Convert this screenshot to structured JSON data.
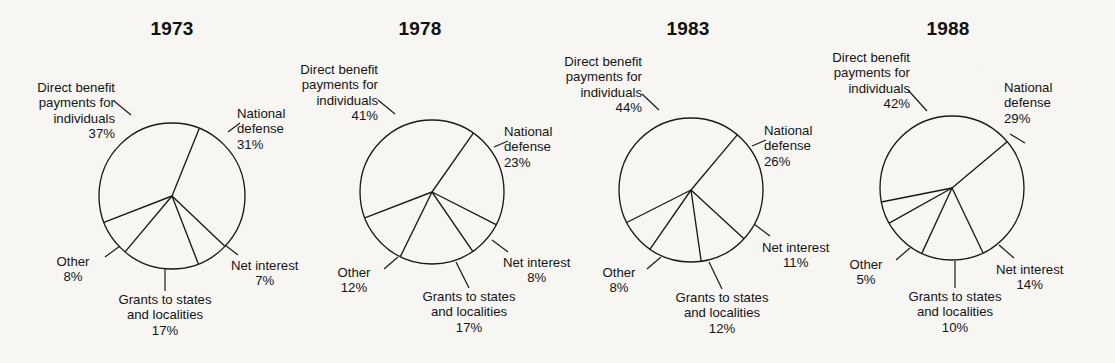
{
  "figure": {
    "background_color": "#f7f6f3",
    "ink_color": "#141414"
  },
  "chart_data": [
    {
      "type": "pie",
      "title": "1973",
      "labels": [
        "National defense",
        "Net interest",
        "Grants to states and localities",
        "Other",
        "Direct benefit payments for individuals"
      ],
      "values": [
        31,
        7,
        17,
        8,
        37
      ],
      "unit": "%",
      "start_angle_deg": -68,
      "direction": "clockwise"
    },
    {
      "type": "pie",
      "title": "1978",
      "labels": [
        "National defense",
        "Net interest",
        "Grants to states and localities",
        "Other",
        "Direct benefit payments for individuals"
      ],
      "values": [
        23,
        8,
        17,
        12,
        41
      ],
      "unit": "%",
      "start_angle_deg": -55,
      "direction": "clockwise"
    },
    {
      "type": "pie",
      "title": "1983",
      "labels": [
        "National defense",
        "Net interest",
        "Grants to states and localities",
        "Other",
        "Direct benefit payments for individuals"
      ],
      "values": [
        26,
        11,
        12,
        8,
        44
      ],
      "unit": "%",
      "start_angle_deg": -50,
      "direction": "clockwise"
    },
    {
      "type": "pie",
      "title": "1988",
      "labels": [
        "National defense",
        "Net interest",
        "Grants to states and localities",
        "Other",
        "Direct benefit payments for individuals"
      ],
      "values": [
        29,
        14,
        10,
        5,
        42
      ],
      "unit": "%",
      "start_angle_deg": -40,
      "direction": "clockwise"
    }
  ],
  "panels": [
    {
      "title": "1973",
      "labels": {
        "direct_benefit": {
          "l1": "Direct benefit",
          "l2": "payments for",
          "l3": "individuals",
          "pct": "37%"
        },
        "national_defense": {
          "l1": "National",
          "l2": "defense",
          "pct": "31%"
        },
        "net_interest": {
          "l1": "Net interest",
          "pct": "7%"
        },
        "grants": {
          "l1": "Grants to states",
          "l2": "and localities",
          "pct": "17%"
        },
        "other": {
          "l1": "Other",
          "pct": "8%"
        }
      }
    },
    {
      "title": "1978",
      "labels": {
        "direct_benefit": {
          "l1": "Direct benefit",
          "l2": "payments for",
          "l3": "individuals",
          "pct": "41%"
        },
        "national_defense": {
          "l1": "National",
          "l2": "defense",
          "pct": "23%"
        },
        "net_interest": {
          "l1": "Net interest",
          "pct": "8%"
        },
        "grants": {
          "l1": "Grants to states",
          "l2": "and localities",
          "pct": "17%"
        },
        "other": {
          "l1": "Other",
          "pct": "12%"
        }
      }
    },
    {
      "title": "1983",
      "labels": {
        "direct_benefit": {
          "l1": "Direct benefit",
          "l2": "payments for",
          "l3": "individuals",
          "pct": "44%"
        },
        "national_defense": {
          "l1": "National",
          "l2": "defense",
          "pct": "26%"
        },
        "net_interest": {
          "l1": "Net interest",
          "pct": "11%"
        },
        "grants": {
          "l1": "Grants to states",
          "l2": "and localities",
          "pct": "12%"
        },
        "other": {
          "l1": "Other",
          "pct": "8%"
        }
      }
    },
    {
      "title": "1988",
      "labels": {
        "direct_benefit": {
          "l1": "Direct benefit",
          "l2": "payments for",
          "l3": "individuals",
          "pct": "42%"
        },
        "national_defense": {
          "l1": "National",
          "l2": "defense",
          "pct": "29%"
        },
        "net_interest": {
          "l1": "Net interest",
          "pct": "14%"
        },
        "grants": {
          "l1": "Grants to states",
          "l2": "and localities",
          "pct": "10%"
        },
        "other": {
          "l1": "Other",
          "pct": "5%"
        }
      }
    }
  ]
}
